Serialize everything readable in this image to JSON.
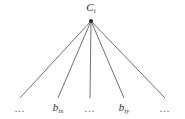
{
  "figure": {
    "type": "fan-tree-diagram",
    "background_color": "#ffffff",
    "edge_color": "#4a4a4a",
    "text_color": "#2b2b2b",
    "root": {
      "name": "root-node",
      "base": "C",
      "subscript": "i",
      "full_label": "C_i",
      "apex_x": 91,
      "apex_y": 21
    },
    "leaves": [
      {
        "name": "leaf-ellipsis-left",
        "label": "...",
        "x": 20,
        "y": 98,
        "kind": "ellipsis"
      },
      {
        "name": "leaf-bix",
        "base": "b",
        "subscript": "ix",
        "label": "b_ix",
        "x": 58,
        "y": 98,
        "kind": "node"
      },
      {
        "name": "leaf-ellipsis-middle",
        "label": "...",
        "x": 90,
        "y": 98,
        "kind": "ellipsis"
      },
      {
        "name": "leaf-biy",
        "base": "b",
        "subscript": "iy",
        "label": "b_iy",
        "x": 124,
        "y": 98,
        "kind": "node"
      },
      {
        "name": "leaf-ellipsis-right",
        "label": "...",
        "x": 165,
        "y": 98,
        "kind": "ellipsis"
      }
    ],
    "edge_count": 5
  }
}
